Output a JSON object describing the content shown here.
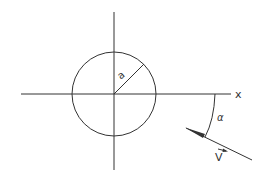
{
  "diagram": {
    "labels": {
      "radius": "a",
      "x_axis": "x",
      "angle": "α",
      "velocity": "V"
    },
    "colors": {
      "line": "#333333",
      "background": "#ffffff"
    },
    "elements": [
      {
        "type": "axis",
        "name": "x-axis"
      },
      {
        "type": "axis",
        "name": "y-axis"
      },
      {
        "type": "circle",
        "name": "cylinder",
        "radius_label": "a"
      },
      {
        "type": "vector",
        "name": "free-stream-velocity",
        "label": "V"
      },
      {
        "type": "arc",
        "name": "angle-of-attack",
        "label": "α"
      }
    ]
  }
}
